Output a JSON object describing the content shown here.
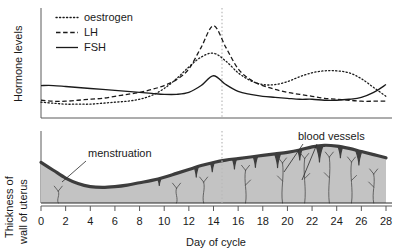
{
  "figure": {
    "colors": {
      "axis": "#5a5a5a",
      "curve": "#1a1a1a",
      "lining_fill": "#c3c3c3",
      "lining_edge": "#3d3d3d",
      "guide_line": "#b9b9b9",
      "text": "#1a1a1a"
    }
  },
  "top_panel": {
    "y_axis_label": "Hormone levels",
    "legend": {
      "items": [
        {
          "label": "oestrogen",
          "style": "dotted"
        },
        {
          "label": "LH",
          "style": "dashed"
        },
        {
          "label": "FSH",
          "style": "solid"
        }
      ]
    },
    "guide_line_day": 14.6
  },
  "bottom_panel": {
    "y_axis_label_line1": "Thickness of",
    "y_axis_label_line2": "wall of uterus",
    "annotations": [
      {
        "name": "menstruation",
        "text": "menstruation"
      },
      {
        "name": "blood-vessels",
        "text": "blood vessels"
      }
    ],
    "guide_line_day": 14.6
  },
  "x_axis": {
    "title": "Day of cycle",
    "ticks": [
      0,
      2,
      4,
      6,
      8,
      10,
      12,
      14,
      16,
      18,
      20,
      22,
      24,
      26,
      28
    ],
    "tick_labels": [
      "0",
      "2",
      "4",
      "6",
      "8",
      "10",
      "12",
      "14",
      "16",
      "18",
      "20",
      "22",
      "24",
      "26",
      "28"
    ],
    "min": 0,
    "max": 28
  },
  "chart_data": {
    "type": "line",
    "title": "Hormone levels",
    "xlabel": "Day of cycle",
    "ylabel": "Hormone levels",
    "xlim": [
      0,
      28
    ],
    "ylim": [
      0,
      100
    ],
    "grid": false,
    "legend_position": "top-left",
    "x": [
      0,
      1,
      2,
      3,
      4,
      5,
      6,
      7,
      8,
      9,
      10,
      11,
      12,
      13,
      14,
      15,
      16,
      17,
      18,
      19,
      20,
      21,
      22,
      23,
      24,
      25,
      26,
      27,
      28
    ],
    "series": [
      {
        "name": "oestrogen",
        "style": "dotted",
        "values": [
          10,
          9,
          8,
          8,
          8,
          9,
          10,
          11,
          13,
          17,
          24,
          34,
          46,
          56,
          60,
          52,
          40,
          32,
          28,
          28,
          31,
          36,
          40,
          42,
          42,
          40,
          34,
          25,
          16
        ]
      },
      {
        "name": "LH",
        "style": "dashed",
        "values": [
          12,
          11,
          11,
          12,
          13,
          14,
          16,
          18,
          20,
          23,
          27,
          33,
          44,
          66,
          88,
          66,
          44,
          33,
          27,
          23,
          20,
          18,
          16,
          14,
          13,
          12,
          11,
          11,
          11
        ]
      },
      {
        "name": "FSH",
        "style": "solid",
        "values": [
          27,
          27,
          26,
          25,
          24,
          23,
          22,
          21,
          20,
          19,
          18,
          18,
          20,
          27,
          37,
          28,
          21,
          18,
          16,
          15,
          14,
          13,
          13,
          12,
          12,
          13,
          15,
          20,
          28
        ]
      }
    ]
  },
  "uterus_lining_data": {
    "type": "area",
    "title": "Thickness of wall of uterus",
    "xlabel": "Day of cycle",
    "ylabel": "Thickness of wall of uterus",
    "xlim": [
      0,
      28
    ],
    "x": [
      0,
      1,
      2,
      3,
      4,
      5,
      6,
      7,
      8,
      9,
      10,
      11,
      12,
      13,
      14,
      15,
      16,
      17,
      18,
      19,
      20,
      21,
      22,
      23,
      24,
      25,
      26,
      27,
      28
    ],
    "thickness": [
      52,
      42,
      32,
      25,
      21,
      20,
      21,
      23,
      26,
      29,
      33,
      38,
      43,
      48,
      52,
      55,
      57,
      59,
      61,
      63,
      65,
      68,
      72,
      74,
      73,
      70,
      66,
      62,
      58
    ],
    "phases": [
      {
        "name": "menstruation",
        "days": [
          0,
          5
        ]
      },
      {
        "name": "proliferative",
        "days": [
          5,
          14
        ]
      },
      {
        "name": "secretory",
        "days": [
          14,
          28
        ]
      }
    ]
  }
}
